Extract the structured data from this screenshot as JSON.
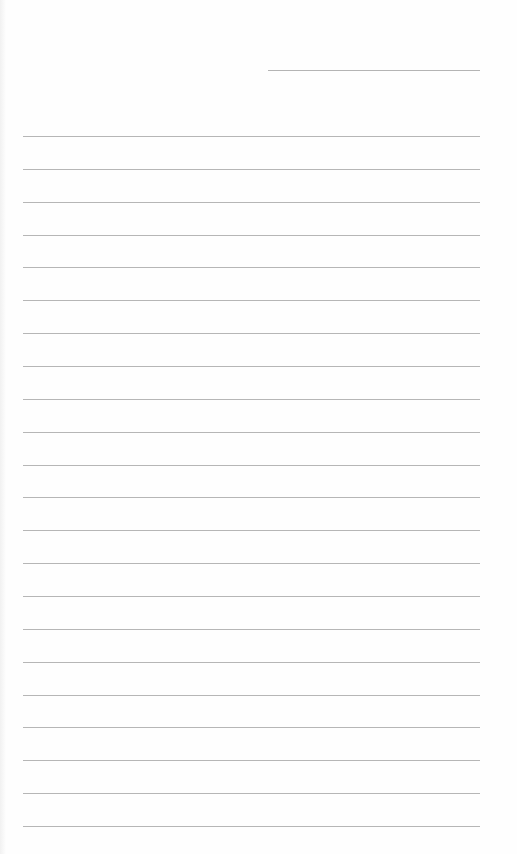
{
  "page": {
    "type": "lined-paper",
    "colors": {
      "background": "#fefefe",
      "rule": "#b6b6b6"
    },
    "header_line": {
      "x": 268,
      "y": 70,
      "width": 212
    },
    "rules": {
      "count": 22,
      "x": 23,
      "width": 457,
      "first_y": 136,
      "spacing": 32.86
    }
  }
}
